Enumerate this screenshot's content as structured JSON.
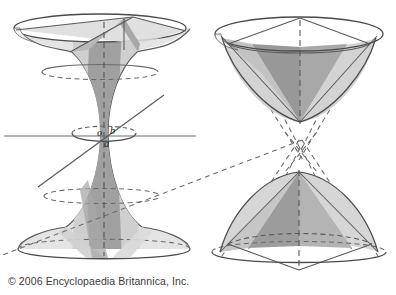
{
  "page": {
    "background_color": "#ffffff",
    "width": 396,
    "height": 295
  },
  "credit": {
    "text": "© 2006 Encyclopaedia Britannica, Inc.",
    "color": "#3a3a3a"
  },
  "palette": {
    "outline": "#4a4a4a",
    "outline_light": "#6e6e6e",
    "dashed": "#5a5a5a",
    "shade_light": "#e2e2e2",
    "shade_medium": "#c9c9c9",
    "shade_dark": "#9b9b9b",
    "shade_darker": "#8d8d8d",
    "axis_line": "#6a6a6a",
    "label_color": "#1d1d1d"
  },
  "figures": [
    {
      "id": "hyperboloid-one-sheet",
      "name": "one-sheeted hyperboloid",
      "position": "left",
      "labels": [
        {
          "id": "origin",
          "text": "o",
          "x": 100,
          "y": 133
        },
        {
          "id": "semi-axis-b",
          "text": "b",
          "x": 113,
          "y": 131
        },
        {
          "id": "semi-axis-a",
          "text": "a",
          "x": 107,
          "y": 144
        }
      ],
      "axis_line": {
        "x1": 4,
        "y1": 136,
        "x2": 196,
        "y2": 136
      },
      "tangent_line": {
        "x1": 38,
        "y1": 186,
        "x2": 163,
        "y2": 96
      }
    },
    {
      "id": "hyperboloid-two-sheets",
      "name": "two-sheeted hyperboloid",
      "position": "right",
      "labels": [],
      "asymptote_crossing": {
        "x": 301,
        "y": 150
      }
    }
  ]
}
